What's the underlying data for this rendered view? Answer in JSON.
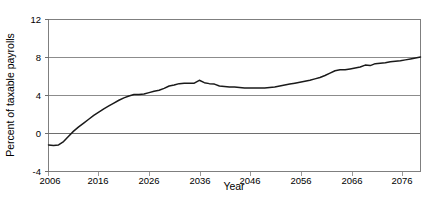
{
  "chart_data": {
    "type": "line",
    "title": "",
    "subtitle": "",
    "xlabel": "Year",
    "ylabel": "Percent of taxable payrolls",
    "xlim": [
      2006,
      2080
    ],
    "ylim": [
      -4,
      12
    ],
    "grid": true,
    "gridlines_y": [
      0,
      4,
      8,
      12
    ],
    "legend": "none",
    "xticks": [
      2006,
      2016,
      2026,
      2036,
      2046,
      2056,
      2066,
      2076
    ],
    "xticklabels": [
      "2006",
      "2016",
      "2026",
      "2036",
      "2046",
      "2056",
      "2066",
      "2076"
    ],
    "yticks": [
      -4,
      0,
      4,
      8,
      12
    ],
    "yticklabels": [
      "-4",
      "0",
      "4",
      "8",
      "12"
    ],
    "series": [
      {
        "name": "Cost rate minus income rate",
        "color": "#1a1a1a",
        "x": [
          2006,
          2007,
          2008,
          2009,
          2010,
          2011,
          2012,
          2013,
          2014,
          2015,
          2016,
          2017,
          2018,
          2019,
          2020,
          2021,
          2022,
          2023,
          2024,
          2025,
          2026,
          2027,
          2028,
          2029,
          2030,
          2031,
          2032,
          2033,
          2034,
          2035,
          2036,
          2037,
          2038,
          2039,
          2040,
          2041,
          2042,
          2043,
          2044,
          2045,
          2046,
          2047,
          2048,
          2049,
          2050,
          2051,
          2052,
          2053,
          2054,
          2055,
          2056,
          2057,
          2058,
          2059,
          2060,
          2061,
          2062,
          2063,
          2064,
          2065,
          2066,
          2067,
          2068,
          2069,
          2070,
          2071,
          2072,
          2073,
          2074,
          2075,
          2076,
          2077,
          2078,
          2079,
          2080
        ],
        "y": [
          -1.2,
          -1.25,
          -1.2,
          -0.85,
          -0.3,
          0.25,
          0.7,
          1.1,
          1.5,
          1.9,
          2.25,
          2.6,
          2.9,
          3.2,
          3.5,
          3.75,
          3.95,
          4.1,
          4.1,
          4.15,
          4.3,
          4.45,
          4.55,
          4.75,
          5.0,
          5.1,
          5.25,
          5.3,
          5.3,
          5.3,
          5.6,
          5.35,
          5.25,
          5.2,
          5.0,
          4.95,
          4.9,
          4.9,
          4.85,
          4.8,
          4.8,
          4.8,
          4.8,
          4.8,
          4.85,
          4.9,
          5.0,
          5.1,
          5.2,
          5.3,
          5.4,
          5.5,
          5.6,
          5.75,
          5.9,
          6.1,
          6.35,
          6.6,
          6.7,
          6.7,
          6.8,
          6.9,
          7.0,
          7.2,
          7.15,
          7.35,
          7.4,
          7.45,
          7.55,
          7.6,
          7.65,
          7.75,
          7.85,
          7.95,
          8.05
        ]
      }
    ]
  },
  "axes": {
    "y_axis_title": "Percent of taxable payrolls",
    "x_axis_title": "Year"
  }
}
